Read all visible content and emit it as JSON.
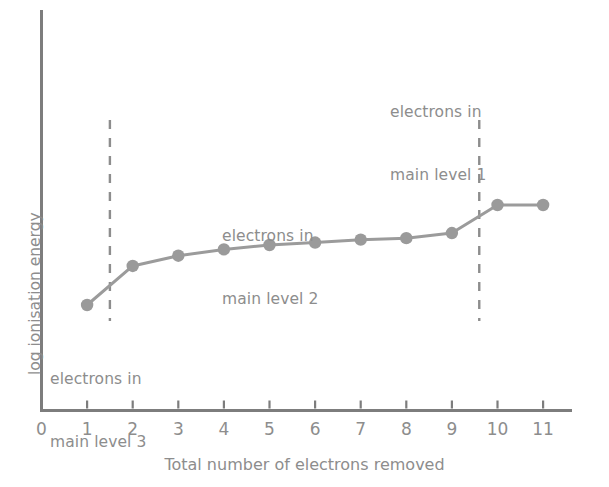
{
  "chart_data": {
    "type": "line",
    "title": "",
    "xlabel": "Total number of electrons removed",
    "ylabel": "log ionisation energy",
    "x": [
      1,
      2,
      3,
      4,
      5,
      6,
      7,
      8,
      9,
      10,
      11
    ],
    "values": [
      1.0,
      2.6,
      3.02,
      3.28,
      3.46,
      3.56,
      3.68,
      3.74,
      3.95,
      5.1,
      5.1
    ],
    "xtick_labels": [
      "0",
      "1",
      "2",
      "3",
      "4",
      "5",
      "6",
      "7",
      "8",
      "9",
      "10",
      "11"
    ],
    "xlim": [
      0,
      11.6
    ],
    "ylim": [
      0,
      6.4
    ],
    "ytick_labels": [],
    "grid": false,
    "legend": null,
    "marker": "circle",
    "series_color": "#9b9b9b",
    "marker_color": "#9a9a9a",
    "axis_color": "#7a7a7a",
    "text_color": "#8d8d8d",
    "annotations": [
      {
        "id": "level-1",
        "text_line1": "electrons in",
        "text_line2": "main level 1",
        "x_data": 10.5,
        "region": "right"
      },
      {
        "id": "level-2",
        "text_line1": "electrons in",
        "text_line2": "main level 2",
        "x_data": 5.6,
        "region": "middle"
      },
      {
        "id": "level-3",
        "text_line1": "electrons in",
        "text_line2": "main level 3",
        "x_data": 1.2,
        "region": "left"
      }
    ],
    "dividers": [
      {
        "id": "divider-left",
        "x_data": 1.5,
        "style": "dashed"
      },
      {
        "id": "divider-right",
        "x_data": 9.6,
        "style": "dashed"
      }
    ]
  }
}
